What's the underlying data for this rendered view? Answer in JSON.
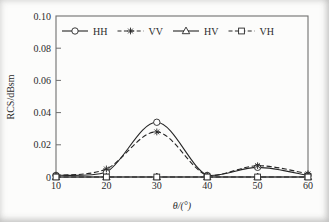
{
  "figure": {
    "background": "#fcfcfb",
    "axis_color": "#6f6f6f",
    "data_color": "#262626",
    "text_color": "#2b2b2b"
  },
  "chart_data": {
    "type": "line",
    "title": "",
    "xlabel": "θ/(°)",
    "ylabel": "RCS/dBsm",
    "x": [
      10,
      20,
      30,
      40,
      50,
      60
    ],
    "xlim": [
      10,
      60
    ],
    "ylim": [
      0,
      0.1
    ],
    "x_tick_labels": [
      "10",
      "20",
      "30",
      "40",
      "50",
      "60"
    ],
    "y_tick_values": [
      0,
      0.02,
      0.04,
      0.06,
      0.08,
      0.1
    ],
    "y_tick_labels": [
      "0",
      "0.02",
      "0.04",
      "0.06",
      "0.08",
      "0.10"
    ],
    "grid": false,
    "legend_position": "inside-top-horizontal",
    "series": [
      {
        "name": "HH",
        "marker": "circle",
        "line_style": "solid",
        "smooth": true,
        "values": [
          0.001,
          0.003,
          0.034,
          0.001,
          0.006,
          0.001
        ]
      },
      {
        "name": "VV",
        "marker": "asterisk",
        "line_style": "dashed",
        "smooth": true,
        "values": [
          0.001,
          0.005,
          0.028,
          0.001,
          0.007,
          0.002
        ]
      },
      {
        "name": "HV",
        "marker": "triangle-up",
        "line_style": "solid",
        "smooth": false,
        "values": [
          0,
          0,
          0,
          0,
          0,
          0
        ]
      },
      {
        "name": "VH",
        "marker": "square",
        "line_style": "dashed",
        "smooth": false,
        "values": [
          0,
          0,
          0,
          0,
          0,
          0
        ]
      }
    ]
  }
}
